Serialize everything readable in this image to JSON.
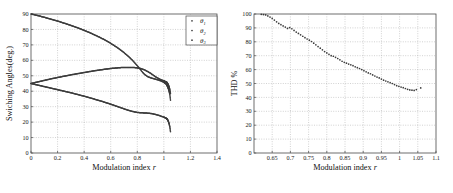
{
  "figure": {
    "background_color": "#ffffff",
    "marker_color": "#3c3c3c",
    "axis_color": "#4a4a4a",
    "grid_color": "#9a9a9a"
  },
  "chart_data": [
    {
      "type": "scatter",
      "panel": "left",
      "title": "",
      "xlabel": "Modulation index r",
      "xlabel_plain": "Modulation index",
      "xlabel_italic": "r",
      "ylabel": "Swiching Angles(deg.)",
      "xlim": [
        0,
        1.4
      ],
      "ylim": [
        0,
        90
      ],
      "xticks": [
        0,
        0.2,
        0.4,
        0.6,
        0.8,
        1,
        1.2,
        1.4
      ],
      "xticklabels": [
        "0",
        "0.2",
        "0.4",
        "0.6",
        "0.8",
        "1",
        "1.2",
        "1.4"
      ],
      "yticks": [
        0,
        10,
        20,
        30,
        40,
        50,
        60,
        70,
        80,
        90
      ],
      "yticklabels": [
        "0",
        "10",
        "20",
        "30",
        "40",
        "50",
        "60",
        "70",
        "80",
        "90"
      ],
      "grid": true,
      "legend_position": "top-right",
      "legend": [
        "θ₁",
        "θ₂",
        "θ₃"
      ],
      "legend_entries": [
        {
          "symbol": "θ",
          "subscript": "1"
        },
        {
          "symbol": "θ",
          "subscript": "2"
        },
        {
          "symbol": "θ",
          "subscript": "3"
        }
      ],
      "series": [
        {
          "name": "θ₁",
          "x": [
            0.0,
            0.02,
            0.04,
            0.06,
            0.08,
            0.1,
            0.12,
            0.14,
            0.16,
            0.18,
            0.2,
            0.22,
            0.24,
            0.26,
            0.28,
            0.3,
            0.32,
            0.34,
            0.36,
            0.38,
            0.4,
            0.42,
            0.44,
            0.46,
            0.48,
            0.5,
            0.52,
            0.54,
            0.56,
            0.58,
            0.6,
            0.62,
            0.64,
            0.66,
            0.68,
            0.7,
            0.72,
            0.74,
            0.76,
            0.78,
            0.8,
            0.82,
            0.84,
            0.86,
            0.88,
            0.9,
            0.92,
            0.94,
            0.96,
            0.98,
            1.0,
            1.01,
            1.02,
            1.025,
            1.03,
            1.035,
            1.04,
            1.045,
            1.05
          ],
          "values": [
            90.0,
            89.6,
            89.2,
            88.8,
            88.3,
            87.9,
            87.4,
            86.9,
            86.4,
            85.9,
            85.4,
            84.9,
            84.3,
            83.8,
            83.2,
            82.6,
            82.0,
            81.4,
            80.8,
            80.1,
            79.4,
            78.7,
            78.0,
            77.2,
            76.4,
            75.6,
            74.8,
            73.9,
            73.0,
            72.0,
            71.0,
            69.9,
            68.8,
            67.6,
            66.3,
            65.0,
            63.5,
            62.0,
            60.3,
            58.5,
            56.5,
            54.4,
            52.2,
            50.5,
            49.4,
            48.7,
            48.2,
            47.7,
            47.2,
            46.6,
            45.8,
            45.2,
            44.4,
            43.6,
            42.6,
            41.4,
            39.8,
            37.8,
            34.2
          ]
        },
        {
          "name": "θ₂",
          "x": [
            0.0,
            0.02,
            0.04,
            0.06,
            0.08,
            0.1,
            0.12,
            0.14,
            0.16,
            0.18,
            0.2,
            0.22,
            0.24,
            0.26,
            0.28,
            0.3,
            0.32,
            0.34,
            0.36,
            0.38,
            0.4,
            0.42,
            0.44,
            0.46,
            0.48,
            0.5,
            0.52,
            0.54,
            0.56,
            0.58,
            0.6,
            0.62,
            0.64,
            0.66,
            0.68,
            0.7,
            0.72,
            0.74,
            0.76,
            0.78,
            0.8,
            0.82,
            0.84,
            0.86,
            0.88,
            0.9,
            0.92,
            0.94,
            0.96,
            0.98,
            1.0,
            1.01,
            1.02,
            1.025,
            1.03,
            1.035,
            1.04,
            1.045,
            1.05
          ],
          "values": [
            45.0,
            45.4,
            45.8,
            46.2,
            46.6,
            47.0,
            47.4,
            47.8,
            48.2,
            48.5,
            48.9,
            49.2,
            49.6,
            49.9,
            50.2,
            50.6,
            50.9,
            51.2,
            51.5,
            51.8,
            52.1,
            52.4,
            52.7,
            53.0,
            53.3,
            53.5,
            53.8,
            54.0,
            54.3,
            54.5,
            54.7,
            54.9,
            55.0,
            55.2,
            55.3,
            55.4,
            55.4,
            55.4,
            55.4,
            55.3,
            55.1,
            54.8,
            54.3,
            53.6,
            52.7,
            51.6,
            50.4,
            49.2,
            48.2,
            47.4,
            46.7,
            46.3,
            45.9,
            45.4,
            44.7,
            43.8,
            42.6,
            41.0,
            38.6
          ]
        },
        {
          "name": "θ₃",
          "x": [
            0.0,
            0.02,
            0.04,
            0.06,
            0.08,
            0.1,
            0.12,
            0.14,
            0.16,
            0.18,
            0.2,
            0.22,
            0.24,
            0.26,
            0.28,
            0.3,
            0.32,
            0.34,
            0.36,
            0.38,
            0.4,
            0.42,
            0.44,
            0.46,
            0.48,
            0.5,
            0.52,
            0.54,
            0.56,
            0.58,
            0.6,
            0.62,
            0.64,
            0.66,
            0.68,
            0.7,
            0.72,
            0.74,
            0.76,
            0.78,
            0.8,
            0.82,
            0.84,
            0.86,
            0.88,
            0.9,
            0.92,
            0.94,
            0.96,
            0.98,
            1.0,
            1.01,
            1.02,
            1.025,
            1.03,
            1.035,
            1.04,
            1.045,
            1.05
          ],
          "values": [
            45.0,
            44.6,
            44.2,
            43.8,
            43.4,
            43.0,
            42.6,
            42.2,
            41.8,
            41.4,
            41.0,
            40.6,
            40.2,
            39.8,
            39.4,
            39.0,
            38.6,
            38.1,
            37.7,
            37.2,
            36.8,
            36.3,
            35.8,
            35.3,
            34.8,
            34.3,
            33.8,
            33.3,
            32.7,
            32.2,
            31.6,
            31.0,
            30.4,
            29.8,
            29.2,
            28.6,
            28.0,
            27.5,
            27.0,
            26.6,
            26.3,
            26.1,
            26.0,
            25.9,
            25.8,
            25.6,
            25.3,
            24.9,
            24.4,
            23.8,
            23.2,
            22.8,
            22.4,
            21.9,
            21.2,
            20.2,
            18.8,
            16.8,
            13.8
          ]
        }
      ]
    },
    {
      "type": "scatter",
      "panel": "right",
      "title": "",
      "xlabel": "Modulation index r",
      "xlabel_plain": "Modulation index",
      "xlabel_italic": "r",
      "ylabel": "THD %",
      "xlim": [
        0.6,
        1.1
      ],
      "ylim": [
        0,
        100
      ],
      "xticks": [
        0.65,
        0.7,
        0.75,
        0.8,
        0.85,
        0.9,
        0.95,
        1,
        1.05,
        1.1
      ],
      "xticklabels": [
        "0.65",
        "0.7",
        "0.75",
        "0.8",
        "0.85",
        "0.9",
        "0.95",
        "1",
        "1.05",
        "1.1"
      ],
      "yticks": [
        0,
        10,
        20,
        30,
        40,
        50,
        60,
        70,
        80,
        90,
        100
      ],
      "yticklabels": [
        "0",
        "10",
        "20",
        "30",
        "40",
        "50",
        "60",
        "70",
        "80",
        "90",
        "100"
      ],
      "grid": true,
      "series": [
        {
          "name": "THD",
          "x": [
            0.62,
            0.626,
            0.632,
            0.638,
            0.644,
            0.65,
            0.656,
            0.662,
            0.668,
            0.674,
            0.68,
            0.686,
            0.692,
            0.698,
            0.704,
            0.71,
            0.716,
            0.722,
            0.728,
            0.734,
            0.74,
            0.746,
            0.752,
            0.758,
            0.764,
            0.77,
            0.776,
            0.782,
            0.788,
            0.794,
            0.8,
            0.806,
            0.812,
            0.818,
            0.824,
            0.83,
            0.836,
            0.842,
            0.848,
            0.854,
            0.86,
            0.866,
            0.872,
            0.878,
            0.884,
            0.89,
            0.896,
            0.902,
            0.908,
            0.914,
            0.92,
            0.926,
            0.932,
            0.938,
            0.944,
            0.95,
            0.956,
            0.962,
            0.968,
            0.974,
            0.98,
            0.986,
            0.992,
            0.998,
            1.004,
            1.01,
            1.016,
            1.022,
            1.028,
            1.034,
            1.04,
            1.046,
            1.058
          ],
          "values": [
            99.8,
            99.6,
            99.3,
            98.6,
            97.8,
            96.8,
            95.6,
            94.4,
            93.2,
            92.3,
            91.4,
            90.6,
            89.6,
            90.2,
            89.4,
            88.2,
            87.0,
            86.0,
            85.0,
            84.0,
            83.0,
            82.0,
            81.2,
            80.2,
            79.0,
            77.8,
            76.6,
            75.4,
            74.2,
            73.0,
            72.0,
            71.0,
            70.0,
            69.6,
            68.8,
            68.0,
            67.0,
            66.0,
            65.2,
            64.6,
            64.0,
            63.4,
            62.8,
            62.0,
            61.4,
            60.8,
            60.0,
            59.2,
            58.4,
            57.6,
            57.0,
            56.2,
            55.4,
            54.6,
            54.0,
            53.2,
            52.4,
            51.8,
            51.2,
            50.6,
            50.0,
            49.2,
            48.4,
            48.0,
            47.4,
            47.0,
            46.4,
            45.8,
            45.4,
            45.2,
            45.0,
            45.6,
            46.8
          ]
        }
      ]
    }
  ]
}
